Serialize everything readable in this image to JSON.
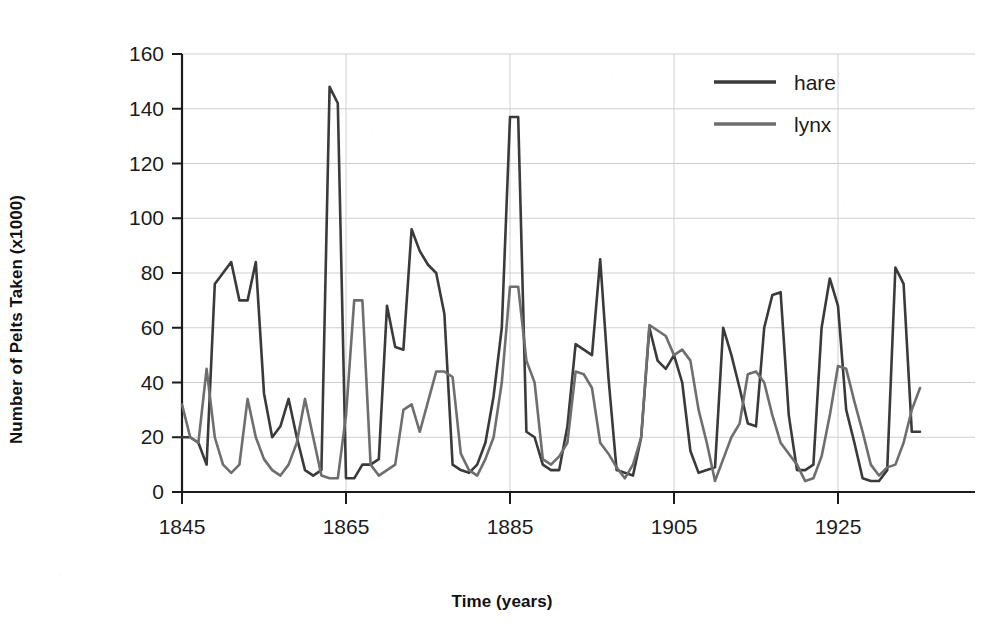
{
  "chart_data": {
    "type": "line",
    "title": "",
    "xlabel": "Time (years)",
    "ylabel": "Number of Pelts Taken (x1000)",
    "xlim": [
      1845,
      1935
    ],
    "ylim": [
      0,
      160
    ],
    "xticks": [
      1845,
      1865,
      1885,
      1905,
      1925
    ],
    "yticks": [
      0,
      20,
      40,
      60,
      80,
      100,
      120,
      140,
      160
    ],
    "grid": "horizontal-and-vertical-light",
    "legend_position": "top-right",
    "x": [
      1845,
      1846,
      1847,
      1848,
      1849,
      1850,
      1851,
      1852,
      1853,
      1854,
      1855,
      1856,
      1857,
      1858,
      1859,
      1860,
      1861,
      1862,
      1863,
      1864,
      1865,
      1866,
      1867,
      1868,
      1869,
      1870,
      1871,
      1872,
      1873,
      1874,
      1875,
      1876,
      1877,
      1878,
      1879,
      1880,
      1881,
      1882,
      1883,
      1884,
      1885,
      1886,
      1887,
      1888,
      1889,
      1890,
      1891,
      1892,
      1893,
      1894,
      1895,
      1896,
      1897,
      1898,
      1899,
      1900,
      1901,
      1902,
      1903,
      1904,
      1905,
      1906,
      1907,
      1908,
      1909,
      1910,
      1911,
      1912,
      1913,
      1914,
      1915,
      1916,
      1917,
      1918,
      1919,
      1920,
      1921,
      1922,
      1923,
      1924,
      1925,
      1926,
      1927,
      1928,
      1929,
      1930,
      1931,
      1932,
      1933,
      1934,
      1935
    ],
    "series": [
      {
        "name": "hare",
        "color": "#3a3a3a",
        "values": [
          20,
          20,
          18,
          10,
          76,
          80,
          84,
          70,
          70,
          84,
          36,
          20,
          24,
          34,
          20,
          8,
          6,
          8,
          148,
          142,
          5,
          5,
          10,
          10,
          12,
          68,
          53,
          52,
          96,
          88,
          83,
          80,
          65,
          10,
          8,
          7,
          10,
          18,
          35,
          60,
          137,
          137,
          22,
          20,
          10,
          8,
          8,
          24,
          54,
          52,
          50,
          85,
          42,
          8,
          7,
          6,
          20,
          60,
          48,
          45,
          50,
          40,
          15,
          7,
          8,
          9,
          60,
          50,
          38,
          25,
          24,
          60,
          72,
          73,
          28,
          8,
          8,
          10,
          60,
          78,
          68,
          30,
          18,
          5,
          4,
          4,
          8,
          82,
          76,
          22,
          22
        ]
      },
      {
        "name": "lynx",
        "color": "#6e6e6e",
        "values": [
          32,
          20,
          18,
          45,
          20,
          10,
          7,
          10,
          34,
          20,
          12,
          8,
          6,
          10,
          18,
          34,
          20,
          6,
          5,
          5,
          28,
          70,
          70,
          10,
          6,
          8,
          10,
          30,
          32,
          22,
          33,
          44,
          44,
          42,
          14,
          8,
          6,
          12,
          20,
          40,
          75,
          75,
          48,
          40,
          12,
          10,
          13,
          18,
          44,
          43,
          38,
          18,
          14,
          9,
          5,
          10,
          20,
          61,
          59,
          57,
          50,
          52,
          48,
          30,
          18,
          4,
          12,
          20,
          25,
          43,
          44,
          40,
          28,
          18,
          14,
          10,
          4,
          5,
          13,
          28,
          46,
          45,
          33,
          22,
          10,
          6,
          9,
          10,
          18,
          30,
          38
        ]
      }
    ]
  },
  "axes": {
    "x_title": "Time (years)",
    "y_title": "Number of Pelts Taken (x1000)",
    "x_tick_labels": [
      "1845",
      "1865",
      "1885",
      "1905",
      "1925"
    ],
    "y_tick_labels": [
      "0",
      "20",
      "40",
      "60",
      "80",
      "100",
      "120",
      "140",
      "160"
    ]
  },
  "legend": {
    "items": [
      {
        "label": "hare",
        "color": "#3a3a3a"
      },
      {
        "label": "lynx",
        "color": "#6e6e6e"
      }
    ]
  },
  "colors": {
    "background": "#ffffff",
    "axis": "#1b1b1b",
    "gridline": "#cfcfcf",
    "hare": "#3a3a3a",
    "lynx": "#6e6e6e"
  }
}
